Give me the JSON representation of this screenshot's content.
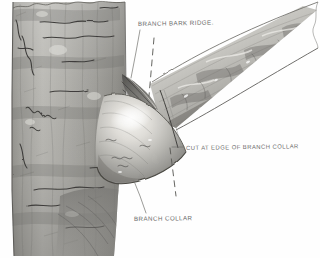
{
  "illustration": {
    "title": "Branch collar pruning diagram",
    "subject": "tree-trunk-with-branch-union",
    "medium": "pencil and wash sketch",
    "background_color": "#ffffff",
    "ink_color": "#6c6c6c",
    "bark_color": "#a9a8a4",
    "bark_shadow_color": "#5d5d5a",
    "bark_highlight_color": "#e9e8e4",
    "branch_color": "#bcbbb7"
  },
  "labels": {
    "branch_bark_ridge": "BRANCH BARK RIDGE.",
    "cut_at_edge": "CUT AT EDGE OF BRANCH COLLAR",
    "branch_collar": "BRANCH COLLAR"
  },
  "annotations": {
    "leader_lines": 3,
    "dashed_cut_lines": 2
  }
}
